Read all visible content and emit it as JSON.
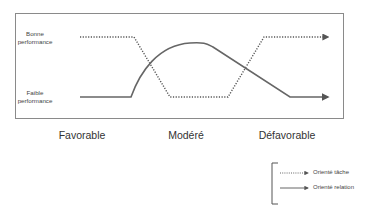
{
  "diagram": {
    "y_labels": {
      "high": [
        "Bonne",
        "performance"
      ],
      "low": [
        "Faible",
        "performance"
      ]
    },
    "x_labels": [
      "Favorable",
      "Modéré",
      "Défavorable"
    ],
    "series": [
      {
        "name": "Orienté tâche",
        "style": "dotted",
        "color": "#555555",
        "path_description": "high at Favorable, drops to low at Modéré, rises to high at Défavorable"
      },
      {
        "name": "Orienté relation",
        "style": "solid",
        "color": "#666666",
        "path_description": "low at Favorable, arcs up to high at Modéré, declines to low at Défavorable"
      }
    ],
    "legend": {
      "items": [
        {
          "label": "Orienté tâche",
          "style": "dotted"
        },
        {
          "label": "Orienté relation",
          "style": "solid"
        }
      ]
    }
  }
}
